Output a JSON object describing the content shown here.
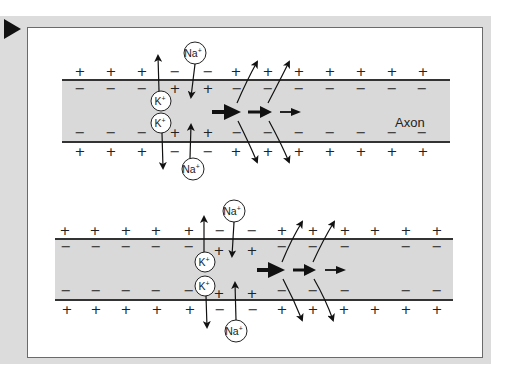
{
  "figure": {
    "type": "axon action potential propagation diagram",
    "colors": {
      "panel_bg": "#dcdcdc",
      "frame_bg": "#ffffff",
      "axon_fill": "#d9d9d9",
      "membrane": "#333333",
      "ink": "#111111"
    },
    "marker_icon": "play-triangle-icon"
  },
  "labels": {
    "axon": "Axon",
    "na_ion": "Na+",
    "k_ion": "K+",
    "plus": "+",
    "minus": "−"
  },
  "top_axon": {
    "outer_top_signs": [
      "+",
      "+",
      "+",
      "−",
      "−",
      "+",
      "+",
      "+",
      "+",
      "+",
      "+",
      "+",
      "+"
    ],
    "inner_top_signs": [
      "−",
      "−",
      "−",
      "+",
      "+",
      "−",
      "−",
      "−",
      "−",
      "−",
      "−",
      "−"
    ],
    "inner_bottom_signs": [
      "−",
      "−",
      "−",
      "+",
      "+",
      "−",
      "−",
      "−",
      "−",
      "−",
      "−",
      "−"
    ],
    "outer_bottom_signs": [
      "+",
      "+",
      "+",
      "−",
      "−",
      "+",
      "+",
      "+",
      "+",
      "+",
      "+",
      "+",
      "+"
    ],
    "ions": [
      "Na+ (in, top)",
      "K+ (out, top)",
      "K+ (out, bottom)",
      "Na+ (in, bottom)"
    ],
    "label": "Axon"
  },
  "bottom_axon": {
    "outer_top_signs": [
      "+",
      "+",
      "+",
      "+",
      "+",
      "−",
      "−",
      "+",
      "+",
      "+",
      "+",
      "+",
      "+"
    ],
    "inner_top_signs": [
      "−",
      "−",
      "−",
      "−",
      "−",
      "+",
      "+",
      "−",
      "−",
      "−",
      "−",
      "−"
    ],
    "inner_bottom_signs": [
      "−",
      "−",
      "−",
      "−",
      "−",
      "+",
      "+",
      "−",
      "−",
      "−",
      "−",
      "−"
    ],
    "outer_bottom_signs": [
      "+",
      "+",
      "+",
      "+",
      "+",
      "−",
      "−",
      "+",
      "+",
      "+",
      "+",
      "+",
      "+"
    ],
    "ions": [
      "Na+ (in, top)",
      "K+ (out, top)",
      "K+ (out, bottom)",
      "Na+ (in, bottom)"
    ]
  }
}
